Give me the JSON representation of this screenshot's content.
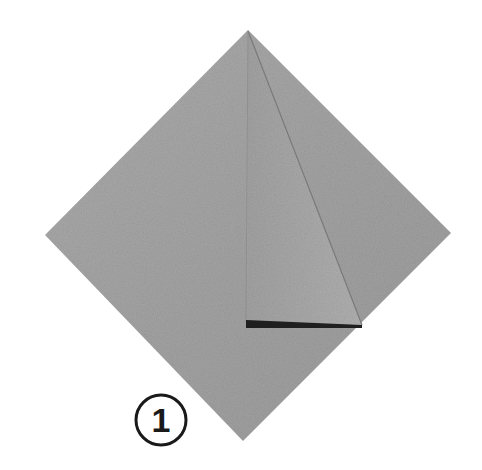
{
  "figure": {
    "type": "origami-step-diagram",
    "step_number": "1",
    "paper_color": "#a6a6a6",
    "paper_shade_color": "#959595",
    "flap_color": "#ababab",
    "crease_color": "#6e6e6e",
    "edge_shadow_color": "#1f1f1f",
    "background_color": "#ffffff"
  }
}
